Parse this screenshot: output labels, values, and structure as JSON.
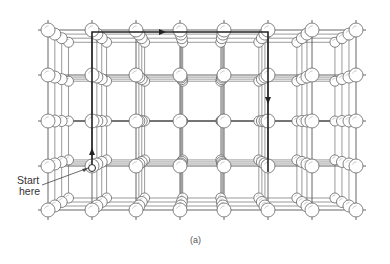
{
  "figure": {
    "start_label_line1": "Start",
    "start_label_line2": "here",
    "caption": "(a)"
  },
  "lattice": {
    "front_x": [
      48,
      92,
      136,
      180,
      224,
      268,
      312,
      356
    ],
    "front_y": [
      30,
      75,
      121,
      166,
      210
    ],
    "center": [
      200,
      121
    ],
    "depth_scales": [
      1.0,
      0.955,
      0.91,
      0.865
    ],
    "sphere_radii": [
      7,
      6,
      5.5,
      5
    ]
  },
  "path": {
    "points": [
      [
        92,
        166
      ],
      [
        92,
        32
      ],
      [
        268,
        32
      ],
      [
        268,
        172
      ]
    ],
    "arrows": [
      {
        "x": 92,
        "y": 152,
        "dir": "up"
      },
      {
        "x": 162,
        "y": 32,
        "dir": "right"
      },
      {
        "x": 268,
        "y": 100,
        "dir": "down"
      }
    ],
    "start_marker": [
      92,
      168
    ],
    "pointer_from": [
      42,
      185
    ],
    "pointer_to": [
      88,
      168
    ]
  },
  "colors": {
    "line": "#555555",
    "path": "#222222",
    "sphere_fill": "#ffffff",
    "sphere_stroke": "#666666"
  }
}
